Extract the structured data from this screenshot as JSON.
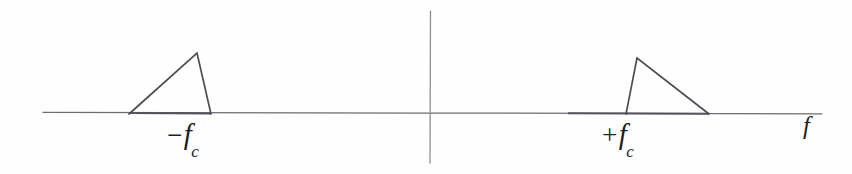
{
  "figure": {
    "background_color": "#fefefe",
    "line_color": "#4d4d55",
    "axis_color": "#6b6b72",
    "width": 852,
    "height": 174
  },
  "axes": {
    "horizontal": {
      "name": "frequency-axis",
      "label": "f",
      "x_start": 43,
      "x_end": 822,
      "y": 113
    },
    "vertical": {
      "name": "origin-axis",
      "label": "",
      "x": 430,
      "y_start": 11,
      "y_end": 163
    }
  },
  "labels": {
    "negative_carrier": {
      "sign": "−",
      "symbol": "f",
      "subscript": "c",
      "text": "−f_c"
    },
    "positive_carrier": {
      "sign": "+",
      "symbol": "f",
      "subscript": "c",
      "text": "+f_c"
    },
    "axis_variable": "f"
  },
  "chart_data": {
    "type": "line",
    "xlabel": "f",
    "ylabel": "",
    "grid": false,
    "legend": "none",
    "xlim": [
      43,
      822
    ],
    "ylim": [
      0,
      1
    ],
    "annotations": [
      {
        "text": "−f_c",
        "x": 200,
        "y": 0
      },
      {
        "text": "+f_c",
        "x": 637,
        "y": 0
      },
      {
        "text": "f",
        "x": 810,
        "y": 0
      }
    ],
    "series": [
      {
        "name": "lower-sideband-lobe",
        "comment": "triangular lobe centred near -f_c, rising slowly then falling steeply",
        "points": [
          {
            "x": 129,
            "y": 114
          },
          {
            "x": 197,
            "y": 53
          },
          {
            "x": 211,
            "y": 114
          },
          {
            "x": 129,
            "y": 114
          }
        ]
      },
      {
        "name": "upper-sideband-lobe",
        "comment": "triangular lobe centred near +f_c, rising steeply then falling slowly",
        "points": [
          {
            "x": 626,
            "y": 114
          },
          {
            "x": 637,
            "y": 58
          },
          {
            "x": 709,
            "y": 114
          },
          {
            "x": 626,
            "y": 114
          }
        ]
      }
    ]
  }
}
